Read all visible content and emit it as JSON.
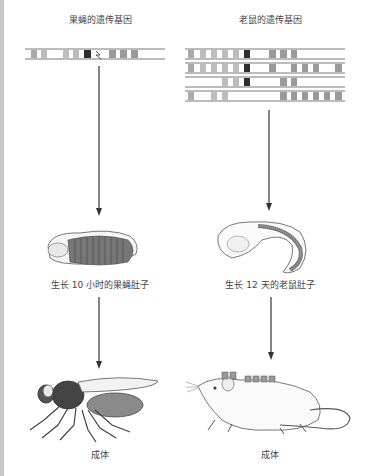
{
  "columns": [
    {
      "organism": "fruit-fly",
      "gene_title": "果蝇的遗传基因",
      "embryo_caption": "生长 10 小时的果蝇肚子",
      "adult_caption": "成体",
      "gene_rows": 1
    },
    {
      "organism": "mouse",
      "gene_title": "老鼠的遗传基因",
      "embryo_caption": "生长 12 天的老鼠肚子",
      "adult_caption": "成体",
      "gene_rows": 4
    }
  ],
  "colors": {
    "gene_light": "#bdbdbd",
    "gene_mid": "#9a9a9a",
    "gene_dark": "#2e2e2e",
    "line": "#555555",
    "edge_strip": "#c8c8c8"
  }
}
